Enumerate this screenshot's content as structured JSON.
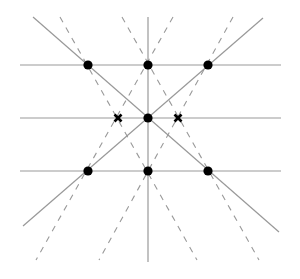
{
  "diagram": {
    "width": 300,
    "height": 279,
    "colors": {
      "line": "#999999",
      "dashed": "#999999",
      "point": "#000000",
      "background": "#ffffff"
    },
    "horizontal_lines": [
      {
        "x1": 20,
        "y1": 65,
        "x2": 281,
        "y2": 65
      },
      {
        "x1": 20,
        "y1": 118,
        "x2": 281,
        "y2": 118
      },
      {
        "x1": 20,
        "y1": 171,
        "x2": 281,
        "y2": 171
      }
    ],
    "vertical_lines": [
      {
        "x1": 148,
        "y1": 17,
        "x2": 148,
        "y2": 262
      }
    ],
    "solid_diagonals": [
      {
        "x1": 33,
        "y1": 17,
        "x2": 279,
        "y2": 232
      },
      {
        "x1": 23,
        "y1": 226,
        "x2": 263,
        "y2": 18
      }
    ],
    "dashed_lines": [
      {
        "x1": 60,
        "y1": 17,
        "x2": 197,
        "y2": 260
      },
      {
        "x1": 173,
        "y1": 17,
        "x2": 36,
        "y2": 260
      },
      {
        "x1": 233,
        "y1": 17,
        "x2": 99,
        "y2": 260
      },
      {
        "x1": 122,
        "y1": 17,
        "x2": 259,
        "y2": 260
      }
    ],
    "points": [
      {
        "x": 88,
        "y": 65
      },
      {
        "x": 148,
        "y": 65
      },
      {
        "x": 208,
        "y": 65
      },
      {
        "x": 148,
        "y": 118
      },
      {
        "x": 88,
        "y": 171
      },
      {
        "x": 148,
        "y": 171
      },
      {
        "x": 208,
        "y": 171
      }
    ],
    "cross_markers": [
      {
        "x": 118,
        "y": 118
      },
      {
        "x": 178,
        "y": 118
      }
    ]
  }
}
